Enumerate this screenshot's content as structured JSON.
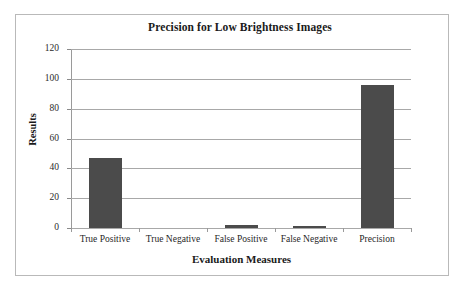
{
  "chart_data": {
    "type": "bar",
    "title": "Precision for Low Brightness Images",
    "xlabel": "Evaluation Measures",
    "ylabel": "Results",
    "categories": [
      "True Positive",
      "True Negative",
      "False Positive",
      "False Negative",
      "Precision"
    ],
    "values": [
      47,
      0,
      2,
      1,
      96
    ],
    "ylim": [
      0,
      120
    ],
    "yticks": [
      0,
      20,
      40,
      60,
      80,
      100,
      120
    ],
    "ytick_labels": [
      "0",
      "20",
      "40",
      "60",
      "80",
      "100",
      "120"
    ],
    "grid": true,
    "legend": "none",
    "series": [
      {
        "name": "Results",
        "values": [
          47,
          0,
          2,
          1,
          96
        ],
        "color": "#4b4b4b"
      }
    ],
    "colors": {
      "bar": "#4b4b4b",
      "gridline": "#a8a8a8",
      "axis": "#9a9a9a",
      "frame": "#b9b9b9",
      "text": "#1a1a1a",
      "background": "#ffffff"
    }
  }
}
